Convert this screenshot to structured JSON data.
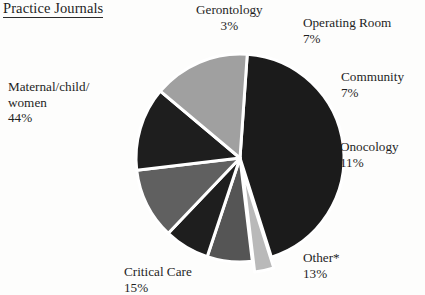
{
  "chart_title": "Practice Journals",
  "chart_data": {
    "type": "pie",
    "title": "Practice Journals",
    "categories": [
      "Maternal/child/women",
      "Critical Care",
      "Other*",
      "Onocology",
      "Community",
      "Operating Room",
      "Gerontology"
    ],
    "values": [
      44,
      15,
      13,
      11,
      7,
      7,
      3
    ],
    "unit": "%",
    "legend": "none",
    "labels_position": "outside-callout",
    "slices": [
      {
        "name": "Maternal/child/women",
        "label_line1": "Maternal/child/",
        "label_line2": "women",
        "percent_text": "44%",
        "value": 44,
        "color": "#1b1b1b",
        "exploded": false
      },
      {
        "name": "Gerontology",
        "label_line1": "Gerontology",
        "percent_text": "3%",
        "value": 3,
        "color": "#b9b9b9",
        "exploded": true
      },
      {
        "name": "Operating Room",
        "label_line1": "Operating Room",
        "percent_text": "7%",
        "value": 7,
        "color": "#555555",
        "exploded": false
      },
      {
        "name": "Community",
        "label_line1": "Community",
        "percent_text": "7%",
        "value": 7,
        "color": "#1e1e1e",
        "exploded": false
      },
      {
        "name": "Onocology",
        "label_line1": "Onocology",
        "percent_text": "11%",
        "value": 11,
        "color": "#606060",
        "exploded": false
      },
      {
        "name": "Other*",
        "label_line1": "Other*",
        "percent_text": "13%",
        "value": 13,
        "color": "#1e1e1e",
        "exploded": false
      },
      {
        "name": "Critical Care",
        "label_line1": "Critical Care",
        "percent_text": "15%",
        "value": 15,
        "color": "#a0a0a0",
        "exploded": false
      }
    ],
    "geometry": {
      "center_x": 240,
      "center_y": 158,
      "radius": 104,
      "start_angle_deg": -86,
      "separator_color": "#ffffff",
      "separator_width": 3
    }
  }
}
